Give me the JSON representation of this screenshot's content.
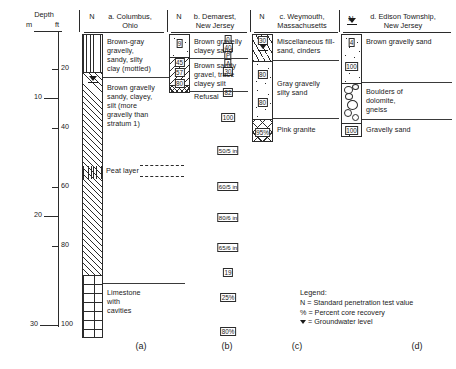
{
  "figure": {
    "depth_header": "Depth",
    "unit_m": "m",
    "unit_ft": "ft",
    "m_ticks": [
      "10",
      "20",
      "30"
    ],
    "ft_ticks": [
      "20",
      "40",
      "60",
      "80",
      "100"
    ]
  },
  "columns": [
    {
      "key": "a",
      "panel_label": "(a)",
      "n_header": "N",
      "title_line1": "a. Columbus,",
      "title_line2": "Ohio",
      "strata": [
        {
          "description": [
            "Brown-gray",
            "gravelly,",
            "sandy, silty",
            "clay (mottled)"
          ],
          "n_values": [
            "0",
            "40",
            "P",
            "A",
            "30"
          ],
          "pattern": "clay",
          "groundwater": true
        },
        {
          "description": [
            "Brown gravelly",
            "sandy, clayey,",
            "silt (more",
            "gravelly than",
            "stratum 1)"
          ],
          "n_values": [
            "82",
            "100",
            "50/5 in",
            "60/5 in",
            "80/6 in",
            "65/6 in",
            "19"
          ],
          "pattern": "diag",
          "groundwater": false
        },
        {
          "description": [
            "Limestone",
            "with",
            "cavities"
          ],
          "n_values": [
            "25%",
            "80%"
          ],
          "pattern": "brick",
          "groundwater": false
        }
      ],
      "annotation": "Peat layer"
    },
    {
      "key": "b",
      "panel_label": "(b)",
      "n_header": "N",
      "title_line1": "b. Demarest,",
      "title_line2": "New Jersey",
      "strata": [
        {
          "description": [
            "Brown gravelly",
            "clayey sand"
          ],
          "n_values": [
            "9"
          ],
          "pattern": "sand",
          "groundwater": false
        },
        {
          "description": [
            "Brown sandy",
            "gravel, trace",
            "clayey silt"
          ],
          "n_values": [
            "45",
            "57",
            "80"
          ],
          "pattern": "diag-r",
          "groundwater": false
        },
        {
          "description": [
            "Refusal"
          ],
          "n_values": [],
          "pattern": "refusal",
          "groundwater": false
        }
      ],
      "annotation": ""
    },
    {
      "key": "c",
      "panel_label": "(c)",
      "n_header": "N",
      "title_line1": "c. Weymouth,",
      "title_line2": "Massachusetts",
      "strata": [
        {
          "description": [
            "Miscellaneous fill-",
            "sand, cinders"
          ],
          "n_values": [
            "30"
          ],
          "pattern": "fill",
          "groundwater": true
        },
        {
          "description": [
            "Gray gravelly",
            "silty sand"
          ],
          "n_values": [
            "80",
            "80"
          ],
          "pattern": "sand",
          "groundwater": false
        },
        {
          "description": [
            "Pink granite"
          ],
          "n_values": [
            "95%"
          ],
          "pattern": "xx",
          "groundwater": false
        }
      ],
      "annotation": ""
    },
    {
      "key": "d",
      "panel_label": "(d)",
      "n_header": "N",
      "title_line1": "d. Edison Township,",
      "title_line2": "New Jersey",
      "strata": [
        {
          "description": [
            "Brown gravelly sand"
          ],
          "n_values": [
            "4",
            "100"
          ],
          "pattern": "sand",
          "groundwater": true
        },
        {
          "description": [
            "Boulders of",
            "dolomite,",
            "gneiss"
          ],
          "n_values": [],
          "pattern": "boulders",
          "groundwater": false
        },
        {
          "description": [
            "Gravelly sand"
          ],
          "n_values": [
            "100"
          ],
          "pattern": "sand",
          "groundwater": false
        }
      ],
      "annotation": ""
    }
  ],
  "legend": {
    "title": "Legend:",
    "items": [
      "N = Standard penetration test value",
      "% = Percent core recovery",
      " = Groundwater level"
    ],
    "gw_item_prefix": "",
    "gw_item_text": " = Groundwater level"
  }
}
